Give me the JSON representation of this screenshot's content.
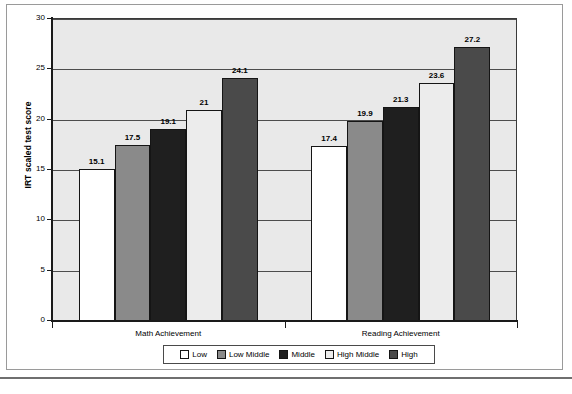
{
  "chart_data": {
    "type": "bar",
    "title": "",
    "xlabel": "",
    "ylabel": "IRT scaled test score",
    "categories": [
      "Math Achievement",
      "Reading Achievement"
    ],
    "ylim": [
      0,
      30
    ],
    "yticks": [
      "0",
      "5",
      "10",
      "15",
      "20",
      "25",
      "30"
    ],
    "ytick_values": [
      0,
      5,
      10,
      15,
      20,
      25,
      30
    ],
    "grid": true,
    "legend_position": "bottom",
    "series": [
      {
        "name": "Low",
        "color": "#ffffff",
        "values": [
          15.1,
          17.4
        ],
        "labels": [
          "15.1",
          "17.4"
        ]
      },
      {
        "name": "Low Middle",
        "color": "#8a8a8a",
        "values": [
          17.5,
          19.9
        ],
        "labels": [
          "17.5",
          "19.9"
        ]
      },
      {
        "name": "Middle",
        "color": "#1f1f1f",
        "values": [
          19.1,
          21.3
        ],
        "labels": [
          "19.1",
          "21.3"
        ]
      },
      {
        "name": "High Middle",
        "color": "#ececec",
        "values": [
          21.0,
          23.6
        ],
        "labels": [
          "21",
          "23.6"
        ]
      },
      {
        "name": "High",
        "color": "#4a4a4a",
        "values": [
          24.1,
          27.2
        ],
        "labels": [
          "24.1",
          "27.2"
        ]
      }
    ]
  },
  "colors": {
    "plot_background": "#e9e9e9",
    "axis": "#1a1a1a",
    "gridline": "#4d4d4d",
    "page_background": "#ffffff"
  }
}
